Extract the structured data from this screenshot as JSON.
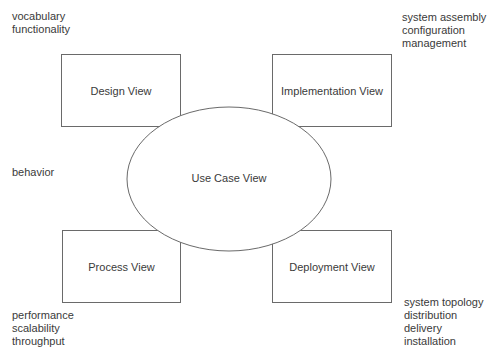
{
  "diagram": {
    "type": "4+1 architectural views",
    "center": {
      "label": "Use Case View",
      "shape": "ellipse"
    },
    "views": [
      {
        "id": "design",
        "label": "Design View",
        "concerns": [
          "vocabulary",
          "functionality"
        ]
      },
      {
        "id": "implementation",
        "label": "Implementation View",
        "concerns": [
          "system assembly",
          "configuration",
          "management"
        ]
      },
      {
        "id": "process",
        "label": "Process View",
        "concerns": [
          "performance",
          "scalability",
          "throughput"
        ]
      },
      {
        "id": "deployment",
        "label": "Deployment View",
        "concerns": [
          "system topology",
          "distribution",
          "delivery",
          "installation"
        ]
      }
    ],
    "center_concerns": [
      "behavior"
    ]
  },
  "colors": {
    "stroke": "#6a6a6a",
    "text": "#3a3a3a",
    "background": "#ffffff"
  }
}
